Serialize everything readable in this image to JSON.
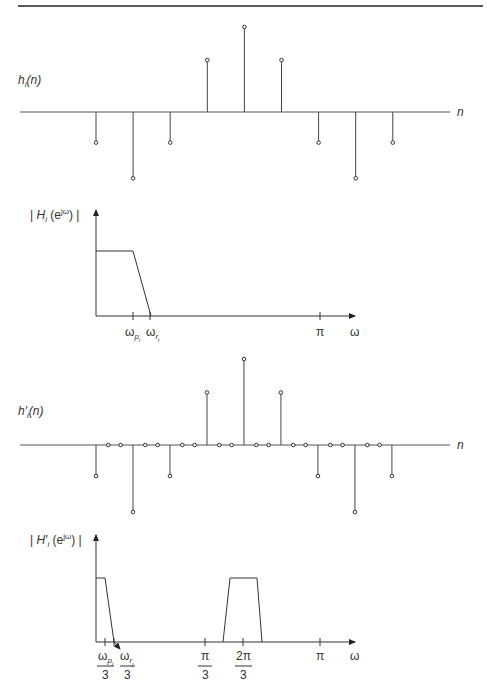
{
  "figure": {
    "top_rule": true,
    "panels": [
      {
        "id": "impulse",
        "label": "h_i(n)",
        "label_parts": {
          "main": "h",
          "sub": "i",
          "arg": "(n)"
        },
        "axis_label": "n"
      },
      {
        "id": "freq",
        "label_parts": {
          "pre": "| ",
          "main": "H",
          "sub": "i",
          "arg1": " (e",
          "sup": "jω",
          "arg2": ") |"
        },
        "axis_label": "ω",
        "ticks": [
          {
            "label": "ω",
            "sub": "p",
            "subsub": "i"
          },
          {
            "label": "ω",
            "sub": "r",
            "subsub": "i"
          },
          {
            "label": "π"
          }
        ]
      },
      {
        "id": "impulse-upsampled",
        "label_parts": {
          "main": "h′",
          "sub": "i",
          "arg": "(n)"
        },
        "axis_label": "n"
      },
      {
        "id": "freq-upsampled",
        "label_parts": {
          "pre": "| ",
          "main": "H′",
          "sub": "i",
          "arg1": " (e",
          "sup": "jω",
          "arg2": ") |"
        },
        "axis_label": "ω",
        "ticks": [
          {
            "num": "ω",
            "sub": "p",
            "subsub": "i",
            "den": "3"
          },
          {
            "num": "ω",
            "sub": "r",
            "subsub": "j",
            "den": "3"
          },
          {
            "num": "π",
            "den": "3"
          },
          {
            "num": "2π",
            "den": "3"
          },
          {
            "label": "π"
          }
        ]
      }
    ]
  },
  "chart_data": [
    {
      "type": "stem",
      "title": "h_i(n)",
      "xlabel": "n",
      "x": [
        -4,
        -3,
        -2,
        -1,
        0,
        1,
        2,
        3,
        4
      ],
      "values": [
        -0.36,
        -0.78,
        -0.36,
        0.61,
        1.0,
        0.61,
        -0.36,
        -0.78,
        -0.36
      ]
    },
    {
      "type": "line",
      "title": "|H_i(e^jω)|",
      "xlabel": "ω",
      "ticks": [
        "ω_p_i",
        "ω_r_i",
        "π"
      ],
      "shape": "lowpass",
      "points": [
        [
          "0",
          1
        ],
        [
          "ω_p_i",
          1
        ],
        [
          "ω_r_i",
          0
        ],
        [
          "π",
          0
        ]
      ]
    },
    {
      "type": "stem",
      "title": "h'_i(n)",
      "xlabel": "n",
      "upsampling_factor": 3,
      "x": [
        -12,
        -11,
        -10,
        -9,
        -8,
        -7,
        -6,
        -5,
        -4,
        -3,
        -2,
        -1,
        0,
        1,
        2,
        3,
        4,
        5,
        6,
        7,
        8,
        9,
        10,
        11,
        12
      ],
      "values": [
        -0.36,
        0,
        0,
        -0.78,
        0,
        0,
        -0.36,
        0,
        0,
        0.61,
        0,
        0,
        1.0,
        0,
        0,
        0.61,
        0,
        0,
        -0.36,
        0,
        0,
        -0.78,
        0,
        0,
        -0.36
      ]
    },
    {
      "type": "line",
      "title": "|H'_i(e^jω)|",
      "xlabel": "ω",
      "ticks": [
        "ω_p_i/3",
        "ω_r_j/3",
        "π/3",
        "2π/3",
        "π"
      ],
      "shape": "lowpass + image band",
      "points": [
        [
          "0",
          1
        ],
        [
          "ω_p_i/3",
          1
        ],
        [
          "ω_r_j/3",
          0
        ],
        [
          "2π/3-ω_r/3",
          0
        ],
        [
          "2π/3-ω_p/3",
          1
        ],
        [
          "2π/3+ω_p/3",
          1
        ],
        [
          "2π/3+ω_r/3",
          0
        ],
        [
          "π",
          0
        ]
      ]
    }
  ],
  "colors": {
    "ink": "#333333",
    "background": "#ffffff"
  }
}
